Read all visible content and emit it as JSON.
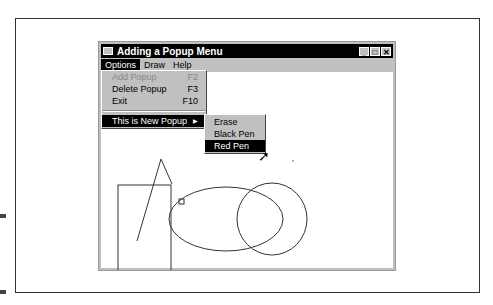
{
  "window": {
    "title": "Adding a Popup Menu",
    "controls": {
      "minimize": "_",
      "maximize": "□",
      "close": "✕"
    }
  },
  "menubar": {
    "items": [
      {
        "label": "Options"
      },
      {
        "label": "Draw"
      },
      {
        "label": "Help"
      }
    ]
  },
  "options_menu": {
    "items": [
      {
        "label": "Add Popup",
        "shortcut": "F2",
        "disabled": true
      },
      {
        "label": "Delete Popup",
        "shortcut": "F3"
      },
      {
        "label": "Exit",
        "shortcut": "F10"
      },
      {
        "label": "This is New Popup",
        "submenu": true,
        "highlighted": true
      }
    ]
  },
  "submenu": {
    "items": [
      {
        "label": "Erase"
      },
      {
        "label": "Black Pen"
      },
      {
        "label": "Red Pen",
        "highlighted": true
      }
    ]
  },
  "submenu_arrow": "▶",
  "cursor_icon": "➚"
}
